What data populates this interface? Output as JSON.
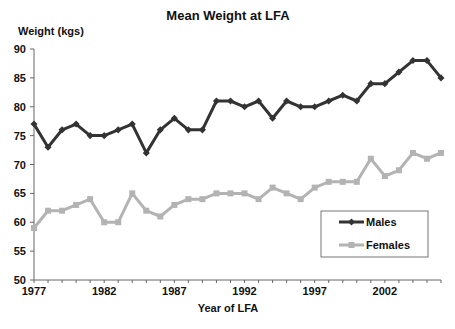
{
  "chart_data": {
    "type": "line",
    "title": "Mean Weight at LFA",
    "xlabel": "Year of LFA",
    "ylabel": "Weight (kgs)",
    "ylim": [
      50,
      90
    ],
    "yticks": [
      50,
      55,
      60,
      65,
      70,
      75,
      80,
      85,
      90
    ],
    "xticks_labeled": [
      1977,
      1982,
      1987,
      1992,
      1997,
      2002
    ],
    "grid": false,
    "legend_position": "lower right inside",
    "x": [
      1977,
      1978,
      1979,
      1980,
      1981,
      1982,
      1983,
      1984,
      1985,
      1986,
      1987,
      1988,
      1989,
      1990,
      1991,
      1992,
      1993,
      1994,
      1995,
      1996,
      1997,
      1998,
      1999,
      2000,
      2001,
      2002,
      2003,
      2004,
      2005,
      2006
    ],
    "series": [
      {
        "name": "Males",
        "color": "#333333",
        "marker": "diamond",
        "values": [
          77,
          73,
          76,
          77,
          75,
          75,
          76,
          77,
          72,
          76,
          78,
          76,
          76,
          81,
          81,
          80,
          81,
          78,
          81,
          80,
          80,
          81,
          82,
          81,
          84,
          84,
          86,
          88,
          88,
          85
        ]
      },
      {
        "name": "Females",
        "color": "#b3b3b3",
        "marker": "square",
        "values": [
          59,
          62,
          62,
          63,
          64,
          60,
          60,
          65,
          62,
          61,
          63,
          64,
          64,
          65,
          65,
          65,
          64,
          66,
          65,
          64,
          66,
          67,
          67,
          67,
          71,
          68,
          69,
          72,
          71,
          72
        ]
      }
    ]
  }
}
